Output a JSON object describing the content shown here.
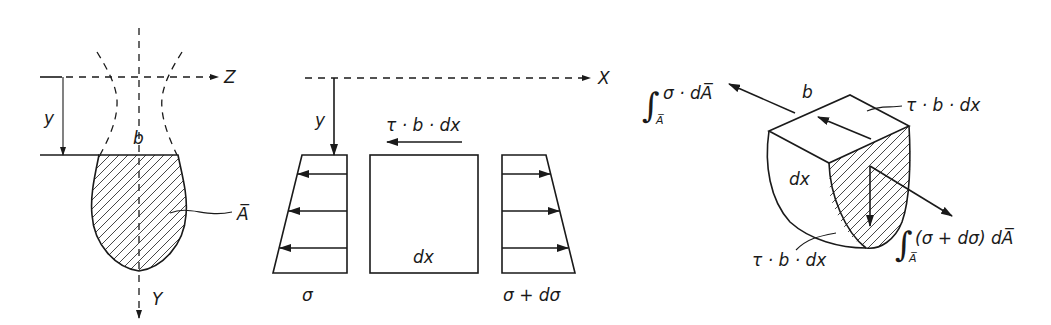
{
  "figure": {
    "panel_cross_section": {
      "axis_horizontal_label": "Z",
      "axis_vertical_label": "Y",
      "distance_label": "y",
      "width_label": "b",
      "area_label": "A̅"
    },
    "panel_side_view": {
      "axis_horizontal_label": "X",
      "distance_label": "y",
      "shear_force_label": "τ · b · dx",
      "element_label": "dx",
      "left_stress_label": "σ",
      "right_stress_label": "σ + dσ"
    },
    "panel_isometric": {
      "integral_symbol": "∫",
      "integral_subscript": "A̅",
      "left_force_label": "σ · dA̅",
      "right_force_label": "(σ + dσ) dA̅",
      "width_label": "b",
      "element_label": "dx",
      "top_shear_label": "τ · b · dx",
      "bottom_shear_label": "τ · b · dx"
    }
  }
}
